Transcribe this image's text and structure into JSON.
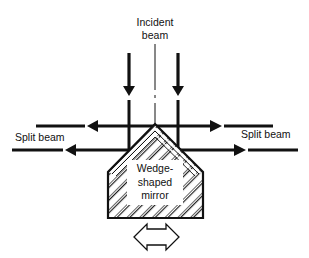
{
  "diagram": {
    "labels": {
      "incident_line1": "Incident",
      "incident_line2": "beam",
      "split_left": "Split beam",
      "split_right": "Split beam",
      "mirror_line1": "Wedge-",
      "mirror_line2": "shaped",
      "mirror_line3": "mirror"
    },
    "colors": {
      "stroke": "#111111",
      "background": "#ffffff"
    },
    "icons": {
      "motion": "double-headed-arrow-icon"
    }
  }
}
